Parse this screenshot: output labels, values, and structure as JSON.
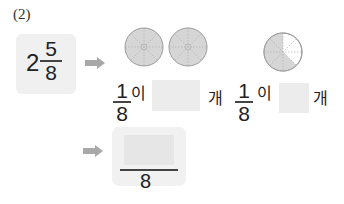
{
  "problem": {
    "label": "(2)",
    "mixed_number": {
      "whole": "2",
      "numerator": "5",
      "denominator": "8"
    },
    "step1": {
      "circles_full_count": 2,
      "circle_sectors": 8,
      "unit_fraction": {
        "numerator": "1",
        "denominator": "8"
      },
      "particle": "이",
      "answer_value": "",
      "counter": "개"
    },
    "step2": {
      "partial_circle_shaded": 5,
      "circle_sectors": 8,
      "unit_fraction": {
        "numerator": "1",
        "denominator": "8"
      },
      "particle": "이",
      "answer_value": "",
      "counter": "개"
    },
    "result": {
      "numerator_value": "",
      "denominator": "8"
    },
    "colors": {
      "box_bg": "#f0f0f0",
      "answer_box_bg": "#ececec",
      "arrow": "#a8a8a8",
      "circle_fill": "#d6d6d6",
      "circle_stroke": "#9a9a9a"
    }
  }
}
